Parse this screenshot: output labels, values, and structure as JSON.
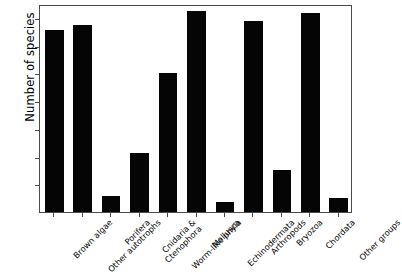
{
  "chart_data": {
    "type": "bar",
    "title": "",
    "xlabel": "",
    "ylabel": "Number of species",
    "ylim": [
      0,
      375
    ],
    "yticks": [
      50,
      100,
      150,
      200,
      250,
      300,
      350
    ],
    "grid": false,
    "legend": null,
    "bar_color": "#050505",
    "axis_color": "#4a4a4a",
    "categories": [
      "Brown algae",
      "Other autotrophs",
      "Porifera",
      "Cnidaria & Ctenophora",
      "Worm-like phyla",
      "Mollusca",
      "Echinodermata",
      "Arthropods",
      "Bryozoa",
      "Chordata",
      "Other groups"
    ],
    "values": [
      328,
      338,
      28,
      106,
      251,
      362,
      18,
      345,
      75,
      359,
      26
    ]
  }
}
